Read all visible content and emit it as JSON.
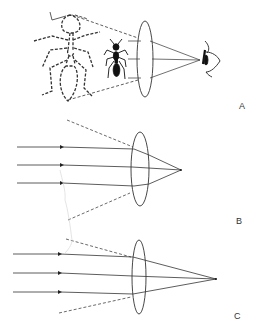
{
  "figure": {
    "colors": {
      "ink": "#333333",
      "background": "#ffffff"
    },
    "panels": [
      {
        "id": "A",
        "label": "A",
        "label_pos": [
          239,
          101
        ],
        "content": "magnifying glass: real ant (small, black) between lens and enlarged dashed virtual image, eye on right",
        "lens": {
          "cx": 145,
          "cy": 59,
          "rx": 8,
          "ry": 38
        },
        "focus": [
          200,
          60
        ],
        "ray_origins_y": [
          40,
          59,
          78
        ],
        "dashed": [
          [
            [
              72,
              15
            ],
            [
              138,
              38
            ]
          ],
          [
            [
              68,
              100
            ],
            [
              138,
              80
            ]
          ]
        ],
        "objects": [
          "virtual-image-ant-dashed",
          "real-ant",
          "eye"
        ]
      },
      {
        "id": "B",
        "label": "B",
        "label_pos": [
          236,
          216
        ],
        "content": "parallel rays through thicker lens converge to near focal point",
        "lens": {
          "cx": 140,
          "cy": 169,
          "rx": 9,
          "ry": 37
        },
        "focus": [
          181,
          170
        ],
        "rays_y": [
          147,
          165,
          183
        ],
        "ray_start_x": 17,
        "arrow_x": 62,
        "dashed": [
          [
            [
              67,
              120
            ],
            [
              133,
              147
            ]
          ],
          [
            [
              68,
              220
            ],
            [
              130,
              193
            ]
          ]
        ]
      },
      {
        "id": "C",
        "label": "C",
        "label_pos": [
          234,
          311
        ],
        "content": "parallel rays through thinner lens converge to farther focal point",
        "lens": {
          "cx": 139,
          "cy": 277,
          "rx": 7,
          "ry": 37
        },
        "focus": [
          216,
          279
        ],
        "rays_y": [
          254,
          273,
          292
        ],
        "ray_start_x": 13,
        "arrow_x": 60,
        "dashed": [
          [
            [
              66,
              239
            ],
            [
              131,
              257
            ]
          ],
          [
            [
              59,
              313
            ],
            [
              131,
              297
            ]
          ]
        ]
      }
    ]
  }
}
